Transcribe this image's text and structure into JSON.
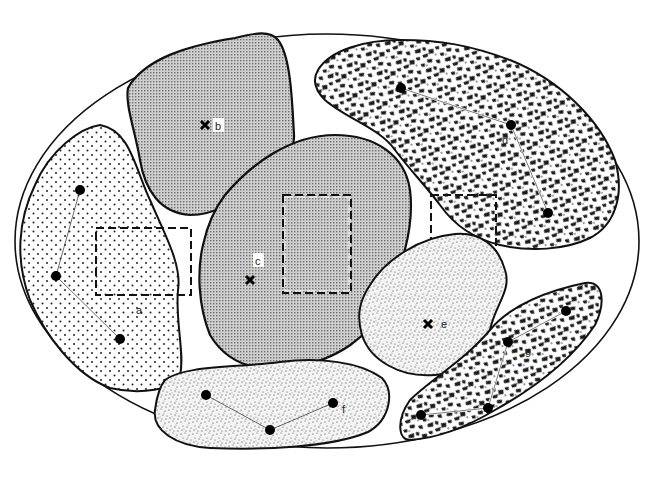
{
  "diagram": {
    "type": "region-map",
    "colors": {
      "outline": "#111111",
      "background": "#ffffff",
      "fine_gray": "#bdbdbd",
      "sparse_dot": "#222222",
      "stipple": "#333333",
      "blotch": "#1a1a1a",
      "marker": "#000000"
    },
    "outer_boundary": "large oval enclosing all regions",
    "regions": [
      {
        "id": "a",
        "label": "a",
        "texture": "sparse regular dots",
        "markers": "3 dots connected by lines",
        "has_dashed_box": true
      },
      {
        "id": "b",
        "label": "b",
        "texture": "fine gray screen",
        "markers": "x centroid",
        "has_dashed_box": false
      },
      {
        "id": "c",
        "label": "c",
        "texture": "fine gray screen",
        "markers": "x centroid",
        "has_dashed_box": true
      },
      {
        "id": "d",
        "label": "d",
        "texture": "dark blotches",
        "markers": "3 dots connected by lines",
        "has_dashed_box": true
      },
      {
        "id": "e",
        "label": "e",
        "texture": "fine stipple",
        "markers": "x centroid",
        "has_dashed_box": false
      },
      {
        "id": "f",
        "label": "f",
        "texture": "fine stipple",
        "markers": "3 dots connected by lines",
        "has_dashed_box": false
      },
      {
        "id": "g",
        "label": "g",
        "texture": "dark blotches",
        "markers": "4 dots connected by lines",
        "has_dashed_box": false
      }
    ]
  }
}
